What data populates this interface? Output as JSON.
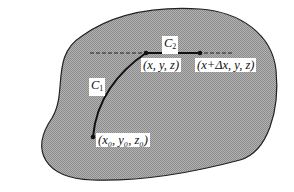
{
  "diagram": {
    "colors": {
      "region_fill": "#a8a8a8",
      "outline": "#222222",
      "curve": "#111111",
      "background": "#ffffff"
    },
    "curves": [
      {
        "id": "C1",
        "label_main": "C",
        "label_sub": "1"
      },
      {
        "id": "C2",
        "label_main": "C",
        "label_sub": "2"
      }
    ],
    "points": [
      {
        "id": "start",
        "label": "(x₀, y₀, z₀)"
      },
      {
        "id": "mid",
        "label": "(x, y, z)"
      },
      {
        "id": "end",
        "label": "(x+Δx, y, z)"
      }
    ],
    "dashed_line": "horizontal reference line through (x, y, z)"
  }
}
